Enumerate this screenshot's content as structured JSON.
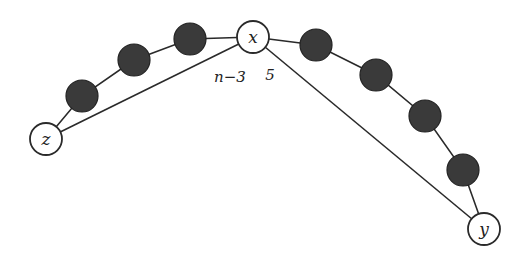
{
  "diagram": {
    "type": "graph",
    "nodes": {
      "x": {
        "label": "x",
        "style": "open"
      },
      "y": {
        "label": "y",
        "style": "open"
      },
      "z": {
        "label": "z",
        "style": "open"
      },
      "left_path_filled_count": 3,
      "right_path_filled_count": 4
    },
    "edges": [
      {
        "from": "z",
        "to": "x",
        "label": "n−3"
      },
      {
        "from": "x",
        "to": "y",
        "label": "5"
      }
    ],
    "paths": [
      {
        "from": "z",
        "to": "x",
        "via": "3 filled vertices"
      },
      {
        "from": "x",
        "to": "y",
        "via": "4 filled vertices"
      }
    ],
    "colors": {
      "filled": "#3a3a3a",
      "stroke": "#2a2a2a",
      "background": "#ffffff"
    }
  }
}
